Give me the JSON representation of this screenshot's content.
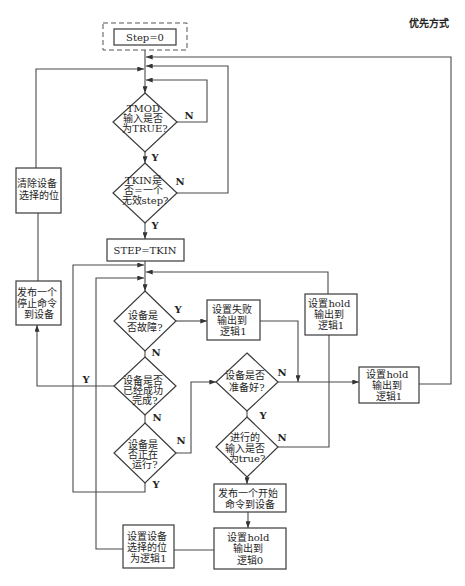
{
  "title": "优先方式",
  "nodes": {
    "start": {
      "lines": [
        "Step=0"
      ]
    },
    "tmod_check": {
      "lines": [
        "TMOD",
        "输入是否",
        "为TRUE?"
      ]
    },
    "tkin_check": {
      "lines": [
        "TKIN是",
        "否=一个",
        "无效step?"
      ]
    },
    "step_assign": {
      "lines": [
        "STEP=TKIN"
      ]
    },
    "clear_select": {
      "lines": [
        "清除设备",
        "选择的位"
      ]
    },
    "stop_command": {
      "lines": [
        "发布一个",
        "停止命令",
        "到设备"
      ]
    },
    "fault_check": {
      "lines": [
        "设备是",
        "否故障?"
      ]
    },
    "completed_check": {
      "lines": [
        "设备是否",
        "已经成功",
        "完成?"
      ]
    },
    "running_check": {
      "lines": [
        "设备是",
        "否正在",
        "运行?"
      ]
    },
    "set_fail": {
      "lines": [
        "设置失败",
        "输出到",
        "逻辑1"
      ]
    },
    "set_hold_1_mid": {
      "lines": [
        "设置hold",
        "输出到",
        "逻辑1"
      ]
    },
    "ready_check": {
      "lines": [
        "设备是否",
        "准备好?"
      ]
    },
    "input_check": {
      "lines": [
        "进行的",
        "输入是否",
        "为true?"
      ]
    },
    "set_hold_1_right": {
      "lines": [
        "设置hold",
        "输出到",
        "逻辑1"
      ]
    },
    "start_command": {
      "lines": [
        "发布一个开始",
        "命令到设备"
      ]
    },
    "set_hold_0": {
      "lines": [
        "设置hold",
        "输出到",
        "逻辑0"
      ]
    },
    "set_select": {
      "lines": [
        "设置设备",
        "选择的位",
        "为逻辑1"
      ]
    }
  },
  "edge_labels": {
    "tmod_no": "N",
    "tmod_yes": "Y",
    "tkin_no": "N",
    "tkin_yes": "Y",
    "fault_yes": "Y",
    "fault_no": "N",
    "completed_yes": "Y",
    "completed_no": "N",
    "running_no": "N",
    "running_yes": "Y",
    "ready_no": "N",
    "ready_yes": "Y",
    "input_no": "N"
  },
  "colors": {
    "line": "#4a4a4a",
    "box_border": "#3a3a3a",
    "text": "#1e1e1e",
    "background": "#ffffff"
  }
}
